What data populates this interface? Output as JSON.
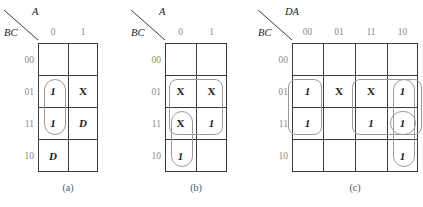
{
  "figure": {
    "type": "karnaugh-maps",
    "count": 3
  },
  "maps": [
    {
      "id": "a",
      "caption": "(a)",
      "col_var": "A",
      "row_var": "BC",
      "col_labels": [
        "0",
        "1"
      ],
      "row_labels": [
        "00",
        "01",
        "11",
        "10"
      ],
      "cells": [
        [
          "",
          ""
        ],
        [
          "1",
          "X"
        ],
        [
          "1",
          "D"
        ],
        [
          "D",
          ""
        ]
      ],
      "groups": [
        {
          "name": "group-col0-rows-01-11",
          "shape": "pill"
        }
      ]
    },
    {
      "id": "b",
      "caption": "(b)",
      "col_var": "A",
      "row_var": "BC",
      "col_labels": [
        "0",
        "1"
      ],
      "row_labels": [
        "00",
        "01",
        "11",
        "10"
      ],
      "cells": [
        [
          "",
          ""
        ],
        [
          "X",
          "X"
        ],
        [
          "X",
          "1"
        ],
        [
          "1",
          ""
        ]
      ],
      "groups": [
        {
          "name": "group-rows-01-11-both-cols",
          "shape": "rrect"
        },
        {
          "name": "group-col0-rows-11-10",
          "shape": "pill"
        }
      ]
    },
    {
      "id": "c",
      "caption": "(c)",
      "col_var": "DA",
      "row_var": "BC",
      "col_labels": [
        "00",
        "01",
        "11",
        "10"
      ],
      "row_labels": [
        "00",
        "01",
        "11",
        "10"
      ],
      "cells": [
        [
          "",
          "",
          "",
          ""
        ],
        [
          "1",
          "X",
          "X",
          "1"
        ],
        [
          "1",
          "",
          "1",
          "1"
        ],
        [
          "",
          "",
          "",
          "1"
        ]
      ],
      "groups": [
        {
          "name": "group-col00-rows-01-11",
          "shape": "rrect"
        },
        {
          "name": "group-cols-11-10-rows-01-11",
          "shape": "rrect"
        },
        {
          "name": "group-col10-rows-01-11-10",
          "shape": "pill"
        },
        {
          "name": "group-col10-row-11",
          "shape": "oval"
        }
      ]
    }
  ],
  "colors": {
    "grid_line": "#3c3c3c",
    "group_outline": "#9a9a9a",
    "header_text": "#8a8a8a",
    "cell_text": "#1a1a1a",
    "caption_text": "#555555",
    "background": "#ffffff"
  }
}
